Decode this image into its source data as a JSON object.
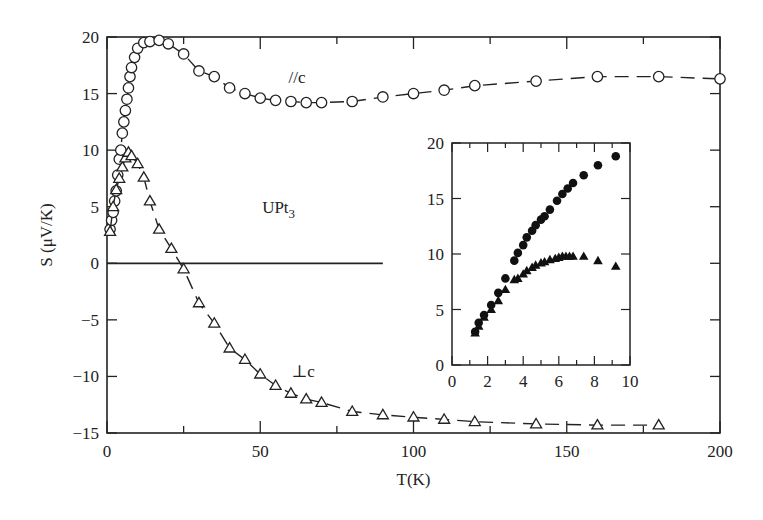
{
  "chart_data": [
    {
      "type": "line",
      "title": "",
      "xlabel": "T(K)",
      "ylabel": "S (μV/K)",
      "xlim": [
        0,
        200
      ],
      "ylim": [
        -15,
        20
      ],
      "xticks": [
        0,
        50,
        100,
        150,
        200
      ],
      "yticks": [
        -15,
        -10,
        -5,
        0,
        5,
        10,
        15,
        20
      ],
      "annotations": [
        "//c",
        "⊥c",
        "UPt3"
      ],
      "series": [
        {
          "name": "//c",
          "marker": "open-circle",
          "x": [
            1,
            1.5,
            2,
            2.5,
            3,
            3.5,
            4,
            4.5,
            5,
            5.5,
            6,
            6.5,
            7,
            7.5,
            8,
            9,
            10,
            12,
            14,
            17,
            20,
            25,
            30,
            35,
            40,
            45,
            50,
            55,
            60,
            65,
            70,
            80,
            90,
            100,
            110,
            120,
            140,
            160,
            180,
            200
          ],
          "y": [
            3,
            3.8,
            4.5,
            5.5,
            6.4,
            7.8,
            9.2,
            10,
            11.5,
            12.5,
            13.5,
            14.5,
            15.5,
            16.5,
            17.3,
            18.2,
            19,
            19.5,
            19.6,
            19.7,
            19.4,
            18.5,
            17,
            16.5,
            15.5,
            15,
            14.6,
            14.4,
            14.3,
            14.2,
            14.2,
            14.3,
            14.7,
            15,
            15.3,
            15.7,
            16.1,
            16.5,
            16.5,
            16.3
          ]
        },
        {
          "name": "⊥c",
          "marker": "open-triangle",
          "x": [
            1,
            2,
            3,
            4,
            5,
            6,
            7,
            8,
            10,
            12,
            14,
            17,
            21,
            25,
            30,
            35,
            40,
            45,
            50,
            55,
            60,
            65,
            70,
            80,
            90,
            100,
            110,
            120,
            140,
            160,
            180
          ],
          "y": [
            2.8,
            5,
            6.5,
            7.5,
            8.5,
            9.3,
            9.8,
            9.5,
            8.8,
            7.6,
            5.5,
            3,
            1.3,
            -0.5,
            -3.5,
            -5.3,
            -7.5,
            -8.5,
            -9.8,
            -10.8,
            -11.5,
            -12,
            -12.3,
            -13.1,
            -13.4,
            -13.6,
            -13.8,
            -14,
            -14.2,
            -14.3,
            -14.3
          ]
        }
      ],
      "reference_line": {
        "y": 0,
        "x_range": [
          0,
          90
        ]
      }
    },
    {
      "type": "scatter",
      "title": "inset",
      "xlabel": "",
      "ylabel": "",
      "xlim": [
        0,
        10
      ],
      "ylim": [
        0,
        20
      ],
      "xticks": [
        0,
        2,
        4,
        6,
        8,
        10
      ],
      "yticks": [
        0,
        5,
        10,
        15,
        20
      ],
      "series": [
        {
          "name": "//c",
          "marker": "filled-circle",
          "x": [
            1.3,
            1.5,
            1.8,
            2.2,
            2.6,
            3.0,
            3.5,
            3.7,
            4.0,
            4.2,
            4.5,
            4.7,
            5.0,
            5.2,
            5.5,
            5.9,
            6.2,
            6.5,
            6.8,
            7.4,
            8.2,
            9.2
          ],
          "y": [
            3.0,
            3.8,
            4.5,
            5.4,
            6.5,
            7.8,
            9.4,
            10.1,
            10.8,
            11.5,
            12.1,
            12.6,
            13.1,
            13.4,
            14.0,
            14.8,
            15.4,
            15.9,
            16.4,
            17.1,
            18.0,
            18.8
          ]
        },
        {
          "name": "⊥c",
          "marker": "filled-triangle",
          "x": [
            1.3,
            1.5,
            1.8,
            2.2,
            2.6,
            3.0,
            3.5,
            3.7,
            4.0,
            4.2,
            4.5,
            4.7,
            5.0,
            5.2,
            5.5,
            5.8,
            6.0,
            6.2,
            6.4,
            6.6,
            6.8,
            7.4,
            8.2,
            9.2
          ],
          "y": [
            2.9,
            3.5,
            4.3,
            5.0,
            5.8,
            6.8,
            7.7,
            7.8,
            8.2,
            8.5,
            8.8,
            9.0,
            9.2,
            9.3,
            9.5,
            9.6,
            9.7,
            9.8,
            9.8,
            9.8,
            9.8,
            9.8,
            9.4,
            8.9
          ]
        }
      ]
    }
  ],
  "labels": {
    "xlabel": "T(K)",
    "ylabel": "S (μV/K)",
    "parallel": "//c",
    "perp": "⊥c",
    "compound_main": "UPt",
    "compound_sub": "3"
  }
}
